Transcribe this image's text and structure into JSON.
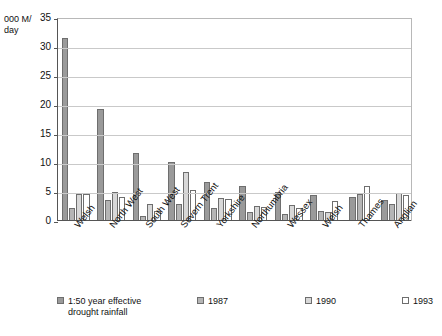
{
  "chart_data": {
    "type": "bar",
    "title": "",
    "subtitle": "",
    "xlabel": "",
    "ylabel": "000 M/\nday",
    "ylim": [
      0,
      35
    ],
    "yticks": [
      0,
      5,
      10,
      15,
      20,
      25,
      30,
      35
    ],
    "grid": true,
    "legend_position": "bottom",
    "categories": [
      "Welsh",
      "North West",
      "South West",
      "Severn Trent",
      "Yorkshire",
      "Northumbria",
      "Wessex",
      "Welsh",
      "Thames",
      "Anglian"
    ],
    "series": [
      {
        "name": "1:50 year effective\ndrought rainfall",
        "color": "#9a9a9a",
        "values": [
          31.5,
          19.3,
          11.8,
          10.2,
          6.7,
          6.1,
          5.0,
          4.4,
          4.2,
          3.6
        ]
      },
      {
        "name": "1987",
        "color": "#b5b5b5",
        "values": [
          2.3,
          3.7,
          0.8,
          3.0,
          2.2,
          1.6,
          1.2,
          1.8,
          4.7,
          3.0
        ]
      },
      {
        "name": "1990",
        "color": "#d8d8d8",
        "values": [
          4.7,
          5.0,
          2.9,
          8.5,
          4.0,
          2.6,
          2.7,
          1.5,
          null,
          4.9
        ]
      },
      {
        "name": "1993",
        "color": "#ffffff",
        "values": [
          4.7,
          4.2,
          1.7,
          5.4,
          3.8,
          2.4,
          2.3,
          3.4,
          6.0,
          4.5
        ]
      }
    ]
  },
  "legend": {
    "items": [
      {
        "label": "1:50 year effective\ndrought rainfall",
        "swatch": "#9a9a9a"
      },
      {
        "label": "1987",
        "swatch": "#b5b5b5"
      },
      {
        "label": "1990",
        "swatch": "#d8d8d8"
      },
      {
        "label": "1993",
        "swatch": "#ffffff"
      }
    ]
  },
  "axis": {
    "y_unit_caption": "000 M/\nday"
  }
}
